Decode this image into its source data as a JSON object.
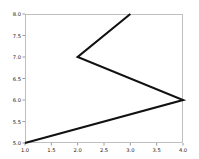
{
  "figure": {
    "background_color": "#ffffff",
    "plot_area": {
      "left": 25,
      "top": 14,
      "right": 183,
      "bottom": 143
    },
    "spine_color": "#b0b0b0",
    "tick_color": "#6e6e6e",
    "label_color": "#1a1a1a"
  },
  "chart_data": {
    "type": "line",
    "title": "",
    "xlabel": "",
    "ylabel": "",
    "xlim": [
      1.0,
      4.0
    ],
    "ylim": [
      5.0,
      8.0
    ],
    "grid": false,
    "legend": null,
    "line_color": "#111111",
    "line_width": 2,
    "x": [
      1.0,
      4.0,
      2.0,
      3.0
    ],
    "y": [
      5.0,
      6.0,
      7.0,
      8.0
    ],
    "points": [
      {
        "x": 1.0,
        "y": 5.0
      },
      {
        "x": 4.0,
        "y": 6.0
      },
      {
        "x": 2.0,
        "y": 7.0
      },
      {
        "x": 3.0,
        "y": 8.0
      }
    ],
    "xticks": [
      1.0,
      1.5,
      2.0,
      2.5,
      3.0,
      3.5,
      4.0
    ],
    "xticklabels": [
      "1.0",
      "1.5",
      "2.0",
      "2.5",
      "3.0",
      "3.5",
      "4.0"
    ],
    "yticks": [
      5.0,
      5.5,
      6.0,
      6.5,
      7.0,
      7.5,
      8.0
    ],
    "yticklabels": [
      "5.0",
      "5.5",
      "6.0",
      "6.5",
      "7.0",
      "7.5",
      "8.0"
    ]
  }
}
